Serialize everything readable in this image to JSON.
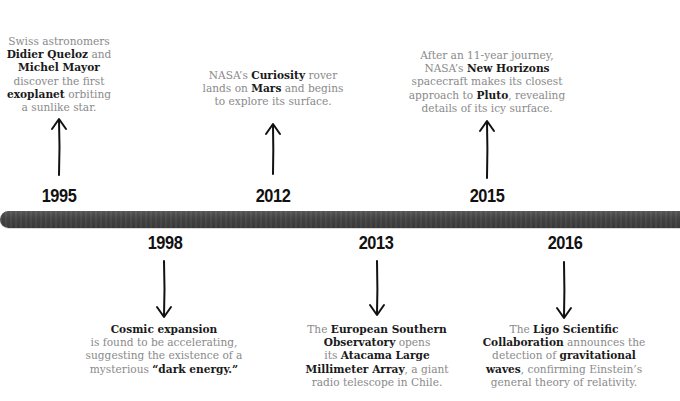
{
  "timeline": {
    "bar_color": "#444444",
    "events": [
      {
        "year": "1995",
        "position": "above",
        "lines": [
          [
            {
              "t": "Swiss astronomers",
              "b": false
            }
          ],
          [
            {
              "t": "Didier Queloz",
              "b": true
            },
            {
              "t": " and",
              "b": false
            }
          ],
          [
            {
              "t": "Michel Mayor",
              "b": true
            }
          ],
          [
            {
              "t": "discover the first",
              "b": false
            }
          ],
          [
            {
              "t": "exoplanet",
              "b": true
            },
            {
              "t": " orbiting",
              "b": false
            }
          ],
          [
            {
              "t": "a sunlike star.",
              "b": false
            }
          ]
        ]
      },
      {
        "year": "1998",
        "position": "below",
        "lines": [
          [
            {
              "t": "Cosmic expansion",
              "b": true
            }
          ],
          [
            {
              "t": "is found to be accelerating,",
              "b": false
            }
          ],
          [
            {
              "t": "suggesting the existence of a",
              "b": false
            }
          ],
          [
            {
              "t": "mysterious ",
              "b": false
            },
            {
              "t": "“dark energy.”",
              "b": true
            }
          ]
        ]
      },
      {
        "year": "2012",
        "position": "above",
        "lines": [
          [
            {
              "t": "NASA’s ",
              "b": false
            },
            {
              "t": "Curiosity",
              "b": true
            },
            {
              "t": " rover",
              "b": false
            }
          ],
          [
            {
              "t": "lands on ",
              "b": false
            },
            {
              "t": "Mars",
              "b": true
            },
            {
              "t": " and begins",
              "b": false
            }
          ],
          [
            {
              "t": "to explore its surface.",
              "b": false
            }
          ]
        ]
      },
      {
        "year": "2013",
        "position": "below",
        "lines": [
          [
            {
              "t": "The ",
              "b": false
            },
            {
              "t": "European Southern",
              "b": true
            }
          ],
          [
            {
              "t": "Observatory",
              "b": true
            },
            {
              "t": " opens",
              "b": false
            }
          ],
          [
            {
              "t": "its ",
              "b": false
            },
            {
              "t": "Atacama Large",
              "b": true
            }
          ],
          [
            {
              "t": "Millimeter Array",
              "b": true
            },
            {
              "t": ", a giant",
              "b": false
            }
          ],
          [
            {
              "t": "radio telescope in Chile.",
              "b": false
            }
          ]
        ]
      },
      {
        "year": "2015",
        "position": "above",
        "lines": [
          [
            {
              "t": "After an 11-year journey,",
              "b": false
            }
          ],
          [
            {
              "t": "NASA’s ",
              "b": false
            },
            {
              "t": "New Horizons",
              "b": true
            }
          ],
          [
            {
              "t": "spacecraft makes its closest",
              "b": false
            }
          ],
          [
            {
              "t": "approach to ",
              "b": false
            },
            {
              "t": "Pluto",
              "b": true
            },
            {
              "t": ", revealing",
              "b": false
            }
          ],
          [
            {
              "t": "details of its icy surface.",
              "b": false
            }
          ]
        ]
      },
      {
        "year": "2016",
        "position": "below",
        "lines": [
          [
            {
              "t": "The ",
              "b": false
            },
            {
              "t": "Ligo Scientific",
              "b": true
            }
          ],
          [
            {
              "t": "Collaboration",
              "b": true
            },
            {
              "t": " announces the",
              "b": false
            }
          ],
          [
            {
              "t": "detection of ",
              "b": false
            },
            {
              "t": "gravitational",
              "b": true
            }
          ],
          [
            {
              "t": "waves",
              "b": true
            },
            {
              "t": ", confirming Einstein’s",
              "b": false
            }
          ],
          [
            {
              "t": "general theory of relativity.",
              "b": false
            }
          ]
        ]
      }
    ]
  }
}
